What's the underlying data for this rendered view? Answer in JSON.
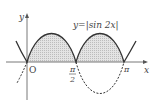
{
  "diagram": {
    "title": "y=|sin 2x|",
    "equation_label": "y=|sin 2x|",
    "axes": {
      "x_label": "x",
      "y_label": "y",
      "origin_label": "O"
    },
    "tick_labels": {
      "half_pi_numerator": "π",
      "half_pi_denominator": "2",
      "pi": "π"
    },
    "curves": [
      {
        "name": "y=|sin 2x|",
        "style": "solid",
        "region": "shaded above x-axis"
      },
      {
        "name": "y=sin 2x (negative part)",
        "style": "dashed"
      }
    ],
    "colors": {
      "curve": "#333333",
      "shade": "#d8d8d8",
      "axis": "#555555"
    }
  }
}
